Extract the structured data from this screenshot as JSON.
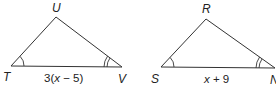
{
  "figure": {
    "stroke_color": "#333333",
    "background": "#ffffff"
  },
  "triangle_left": {
    "vertices": {
      "top": {
        "label": "U",
        "x": 56,
        "y": 17
      },
      "left": {
        "label": "T",
        "x": 11,
        "y": 66
      },
      "right": {
        "label": "V",
        "x": 122,
        "y": 67
      }
    },
    "base_label": {
      "prefix": "3(",
      "var": "x",
      "suffix": " − 5)"
    },
    "angle_marks": {
      "T": "single arc",
      "V": "double arc"
    }
  },
  "triangle_right": {
    "vertices": {
      "top": {
        "label": "R",
        "x": 206,
        "y": 19
      },
      "left": {
        "label": "S",
        "x": 161,
        "y": 67
      },
      "right": {
        "label": "N",
        "x": 275,
        "y": 68
      }
    },
    "base_label": {
      "prefix": "",
      "var": "x",
      "suffix": " + 9"
    },
    "angle_marks": {
      "S": "single arc",
      "N": "double arc"
    }
  }
}
